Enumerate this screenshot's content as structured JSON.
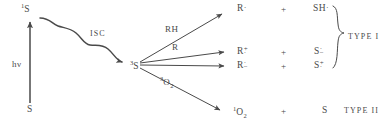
{
  "diagram": {
    "ink_color": "#4a4a4a",
    "background": "#ffffff",
    "excitation": {
      "ground_state_label": "S",
      "excited_singlet_prefix": "1",
      "excited_singlet_base": "S",
      "photon_label": "hν"
    },
    "intersystem_crossing": {
      "label": "ISC"
    },
    "triplet": {
      "prefix": "3",
      "base": "S"
    },
    "reactant_labels": {
      "hydrogen_donor": "RH",
      "electron_donor": "R",
      "oxygen_prefix": "3",
      "oxygen_base": "O",
      "oxygen_sub": "2"
    },
    "operators": {
      "plus": "+"
    },
    "products": [
      {
        "left_base": "R",
        "left_dot": "·",
        "left_charge": "",
        "plus": "+",
        "right_base": "SH",
        "right_dot": "·",
        "right_charge": ""
      },
      {
        "left_base": "R",
        "left_dot": "·",
        "left_charge": "+",
        "plus": "+",
        "right_base": "S",
        "right_dot": "·",
        "right_charge": "−"
      },
      {
        "left_base": "R",
        "left_dot": "·",
        "left_charge": "−",
        "plus": "+",
        "right_base": "S",
        "right_dot": "·",
        "right_charge": "+"
      }
    ],
    "type_two_row": {
      "prefix": "1",
      "base": "O",
      "sub": "2",
      "plus": "+",
      "partner": "S"
    },
    "type_labels": {
      "type_one": "TYPE I",
      "type_two": "TYPE II"
    }
  }
}
